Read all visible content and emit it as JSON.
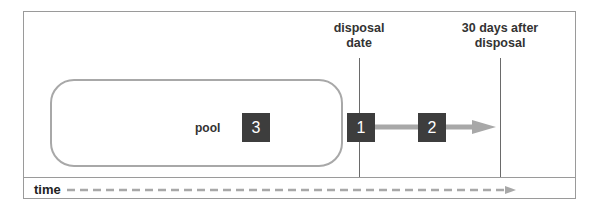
{
  "diagram": {
    "markers": [
      {
        "id": "disposal-date",
        "label_line1": "disposal",
        "label_line2": "date"
      },
      {
        "id": "thirty-days",
        "label_line1": "30 days after",
        "label_line2": "disposal"
      }
    ],
    "pool": {
      "label": "pool"
    },
    "boxes": [
      {
        "number": "1"
      },
      {
        "number": "2"
      },
      {
        "number": "3"
      }
    ],
    "timeline": {
      "label": "time"
    },
    "colors": {
      "box_fill": "#3d3d3d",
      "arrow": "#a8a8a8",
      "pool_border": "#a8a8a8",
      "frame": "#9a9a9a"
    }
  }
}
